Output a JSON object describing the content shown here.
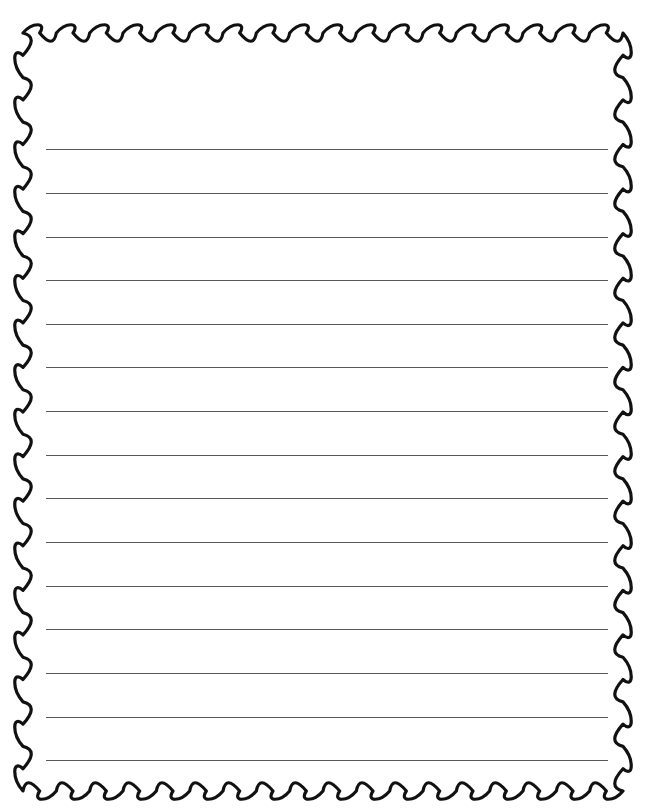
{
  "document": {
    "type": "ruled-writing-paper",
    "title": "Lined Paper Template",
    "page_width": 671,
    "page_height": 810,
    "background_color": "#ffffff"
  },
  "border": {
    "name": "scalloped-wavy-border",
    "style": "wavy",
    "color": "#111111",
    "stroke_width": 3.2,
    "wave_period_horizontal": 33,
    "wave_period_vertical": 45,
    "wave_amplitude": 5.5,
    "top_y": 33,
    "bottom_y": 791,
    "left_x": 23,
    "right_x": 623
  },
  "ruled_area": {
    "name": "writing-lines",
    "line_color": "#58585a",
    "line_thickness": 1,
    "line_start_x": 46,
    "line_end_x": 608,
    "line_count": 15,
    "line_spacing": 43.7,
    "first_line_y": 149,
    "last_line_y": 760,
    "lines": [
      {
        "index": 1,
        "y": 149
      },
      {
        "index": 2,
        "y": 193
      },
      {
        "index": 3,
        "y": 237
      },
      {
        "index": 4,
        "y": 280
      },
      {
        "index": 5,
        "y": 324
      },
      {
        "index": 6,
        "y": 367
      },
      {
        "index": 7,
        "y": 411
      },
      {
        "index": 8,
        "y": 455
      },
      {
        "index": 9,
        "y": 498
      },
      {
        "index": 10,
        "y": 542
      },
      {
        "index": 11,
        "y": 586
      },
      {
        "index": 12,
        "y": 629
      },
      {
        "index": 13,
        "y": 673
      },
      {
        "index": 14,
        "y": 717
      },
      {
        "index": 15,
        "y": 760
      }
    ]
  }
}
